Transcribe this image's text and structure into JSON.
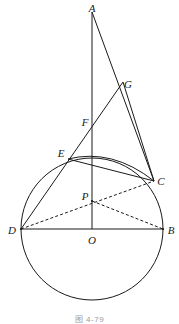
{
  "figure": {
    "caption": "图 4-79",
    "caption_x": 0,
    "caption_y": 315,
    "width": 179,
    "height": 324,
    "background": "#ffffff",
    "stroke_color": "#1a1a1a",
    "label_color": "#1a1a1a",
    "caption_color": "#9a9a9a"
  },
  "points": [
    {
      "id": "A",
      "label": "A",
      "x": 92,
      "y": 12,
      "label_x": 92,
      "label_y": 8,
      "on_circle": false
    },
    {
      "id": "G",
      "label": "G",
      "x": 123,
      "y": 82,
      "label_x": 128,
      "label_y": 84,
      "on_circle": false
    },
    {
      "id": "F",
      "label": "F",
      "x": 92,
      "y": 122,
      "label_x": 85,
      "label_y": 122,
      "on_circle": false
    },
    {
      "id": "E",
      "label": "E",
      "x": 68,
      "y": 159,
      "label_x": 61,
      "label_y": 153,
      "on_circle": true
    },
    {
      "id": "C",
      "label": "C",
      "x": 154,
      "y": 181,
      "label_x": 161,
      "label_y": 181,
      "on_circle": true
    },
    {
      "id": "P",
      "label": "P",
      "x": 92,
      "y": 201,
      "label_x": 85,
      "label_y": 196,
      "on_circle": false
    },
    {
      "id": "D",
      "label": "D",
      "x": 21,
      "y": 229,
      "label_x": 12,
      "label_y": 230,
      "on_circle": true
    },
    {
      "id": "B",
      "label": "B",
      "x": 163,
      "y": 229,
      "label_x": 171,
      "label_y": 230,
      "on_circle": true
    },
    {
      "id": "O",
      "label": "O",
      "x": 92,
      "y": 229,
      "label_x": 92,
      "label_y": 240,
      "on_circle": false
    }
  ],
  "circle": {
    "name": "main-circle",
    "cx": 92,
    "cy": 229,
    "r": 71,
    "style": "solid"
  },
  "arc": {
    "name": "arc-e-c",
    "from": "E",
    "to": "C",
    "d": "M 68 159 Q 112 148 154 181",
    "style": "solid"
  },
  "segments": [
    {
      "name": "segment-A-O",
      "from": "A",
      "to": "O",
      "x1": 92,
      "y1": 12,
      "x2": 92,
      "y2": 229,
      "style": "solid"
    },
    {
      "name": "segment-A-C",
      "from": "A",
      "to": "C",
      "x1": 92,
      "y1": 12,
      "x2": 154,
      "y2": 181,
      "style": "solid"
    },
    {
      "name": "segment-D-G",
      "from": "D",
      "to": "G",
      "x1": 21,
      "y1": 229,
      "x2": 123,
      "y2": 82,
      "style": "solid"
    },
    {
      "name": "segment-G-C",
      "from": "G",
      "to": "C",
      "x1": 123,
      "y1": 82,
      "x2": 154,
      "y2": 181,
      "style": "solid"
    },
    {
      "name": "segment-E-C",
      "from": "E",
      "to": "C",
      "x1": 68,
      "y1": 159,
      "x2": 154,
      "y2": 181,
      "style": "solid"
    },
    {
      "name": "segment-D-B",
      "from": "D",
      "to": "B",
      "x1": 21,
      "y1": 229,
      "x2": 163,
      "y2": 229,
      "style": "solid"
    },
    {
      "name": "segment-D-C",
      "from": "D",
      "to": "C",
      "x1": 21,
      "y1": 229,
      "x2": 154,
      "y2": 181,
      "style": "dashed"
    },
    {
      "name": "segment-P-B",
      "from": "P",
      "to": "B",
      "x1": 92,
      "y1": 201,
      "x2": 163,
      "y2": 229,
      "style": "dashed"
    }
  ]
}
